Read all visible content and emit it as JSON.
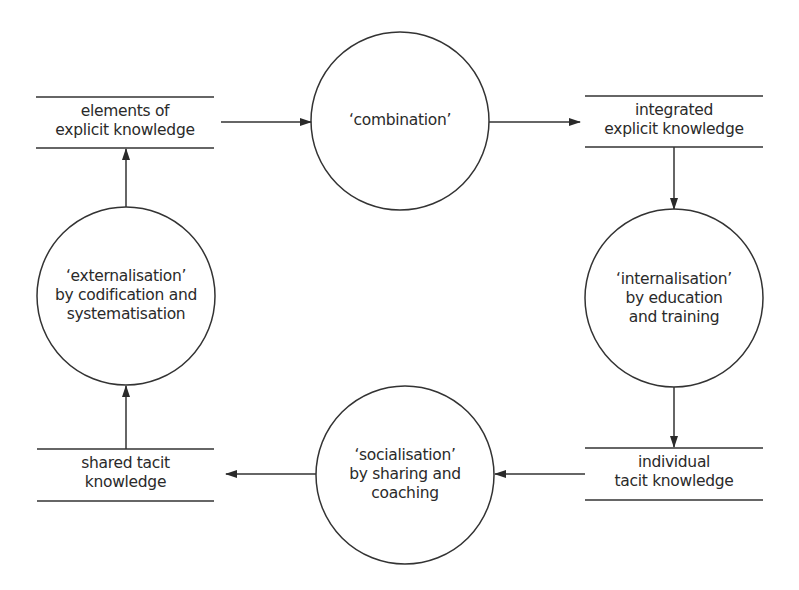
{
  "diagram": {
    "type": "knowledge-conversion-cycle",
    "stroke_color": "#333333",
    "text_color": "#2a2a2a",
    "background": "#ffffff",
    "stores": [
      {
        "id": "elements",
        "lines": [
          "elements of",
          "explicit knowledge"
        ]
      },
      {
        "id": "integrated",
        "lines": [
          "integrated",
          "explicit knowledge"
        ]
      },
      {
        "id": "individual",
        "lines": [
          "individual",
          "tacit knowledge"
        ]
      },
      {
        "id": "shared",
        "lines": [
          "shared tacit",
          "knowledge"
        ]
      }
    ],
    "processes": [
      {
        "id": "combination",
        "lines": [
          "‘combination’"
        ]
      },
      {
        "id": "internalisation",
        "lines": [
          "‘internalisation’",
          "by education",
          "and training"
        ]
      },
      {
        "id": "socialisation",
        "lines": [
          "‘socialisation’",
          "by sharing and",
          "coaching"
        ]
      },
      {
        "id": "externalisation",
        "lines": [
          "‘externalisation’",
          "by codification and",
          "systematisation"
        ]
      }
    ],
    "flows": [
      {
        "from": "elements",
        "to": "combination",
        "direction": "right"
      },
      {
        "from": "combination",
        "to": "integrated",
        "direction": "right"
      },
      {
        "from": "integrated",
        "to": "internalisation",
        "direction": "down"
      },
      {
        "from": "internalisation",
        "to": "individual",
        "direction": "down"
      },
      {
        "from": "individual",
        "to": "socialisation",
        "direction": "left"
      },
      {
        "from": "socialisation",
        "to": "shared",
        "direction": "left"
      },
      {
        "from": "shared",
        "to": "externalisation",
        "direction": "up"
      },
      {
        "from": "externalisation",
        "to": "elements",
        "direction": "up"
      }
    ]
  }
}
